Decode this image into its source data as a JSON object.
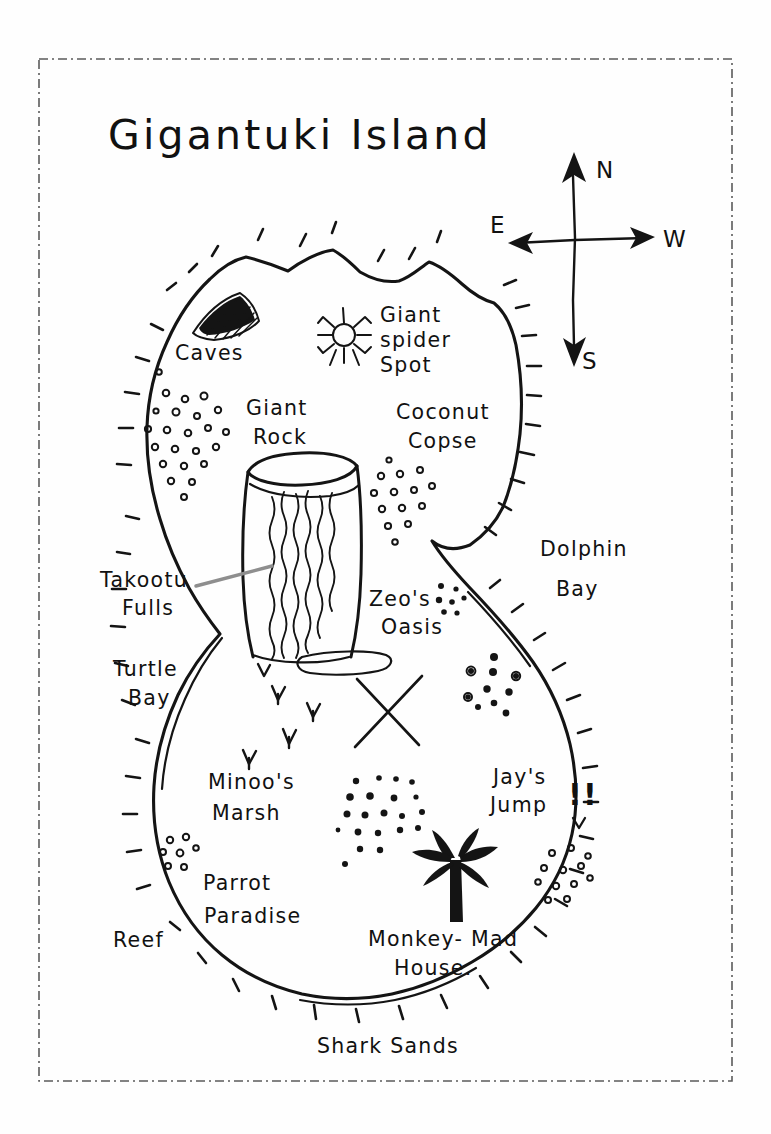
{
  "document": {
    "kind": "hand-drawn treasure map",
    "title": "Gigantuki Island",
    "medium": "black ink on white paper"
  },
  "frame": {
    "style": "dash-dot border",
    "color": "#5b5b5b"
  },
  "compass": {
    "name": "compass-rose",
    "north_label": "N",
    "south_label": "S",
    "east_label": "E",
    "west_label": "W",
    "note": "E drawn on the left arm, W drawn on the right arm"
  },
  "labels": {
    "caves": "Caves",
    "spider_spot_line1": "Giant",
    "spider_spot_line2": "spider",
    "spider_spot_line3": "Spot",
    "giant_rock_line1": "Giant",
    "giant_rock_line2": "Rock",
    "coconut_copse_line1": "Coconut",
    "coconut_copse_line2": "Copse",
    "takootu_falls_line1": "Takootu",
    "takootu_falls_line2": "Fulls",
    "turtle_bay_line1": "Turtle",
    "turtle_bay_line2": "Bay",
    "zeos_oasis_line1": "Zeo's",
    "zeos_oasis_line2": "Oasis",
    "dolphin_bay_line1": "Dolphin",
    "dolphin_bay_line2": "Bay",
    "jays_jump_line1": "Jay's",
    "jays_jump_line2": "Jump",
    "jays_jump_bangs": "!!",
    "minoos_marsh_line1": "Minoo's",
    "minoos_marsh_line2": "Marsh",
    "parrot_paradise_line1": "Parrot",
    "parrot_paradise_line2": "Paradise",
    "reef": "Reef",
    "monkey_mad_house_line1": "Monkey- Mad",
    "monkey_mad_house_line2": "House.",
    "shark_sands": "Shark  Sands"
  },
  "features": [
    {
      "id": "caves",
      "type": "cave-mouth",
      "label": "Caves"
    },
    {
      "id": "giant-spider-spot",
      "type": "spider",
      "label": "Giant spider Spot"
    },
    {
      "id": "giant-rock",
      "type": "rock-column-with-waterfall",
      "label": "Giant Rock"
    },
    {
      "id": "coconut-copse",
      "type": "scatter-dots",
      "label": "Coconut Copse"
    },
    {
      "id": "takootu-falls",
      "type": "waterfall",
      "label": "Takootu Fulls"
    },
    {
      "id": "turtle-bay",
      "type": "bay",
      "label": "Turtle Bay"
    },
    {
      "id": "zeos-oasis",
      "type": "oasis",
      "label": "Zeo's Oasis"
    },
    {
      "id": "dolphin-bay",
      "type": "bay",
      "label": "Dolphin Bay"
    },
    {
      "id": "jays-jump",
      "type": "landmark",
      "label": "Jay's Jump !!"
    },
    {
      "id": "minoos-marsh",
      "type": "marsh",
      "label": "Minoo's Marsh"
    },
    {
      "id": "parrot-paradise",
      "type": "region",
      "label": "Parrot Paradise"
    },
    {
      "id": "reef",
      "type": "reef",
      "label": "Reef"
    },
    {
      "id": "monkey-mad-house",
      "type": "palm-tree",
      "label": "Monkey- Mad House."
    },
    {
      "id": "shark-sands",
      "type": "beach",
      "label": "Shark  Sands"
    },
    {
      "id": "treasure-x",
      "type": "x-mark",
      "label": ""
    }
  ]
}
